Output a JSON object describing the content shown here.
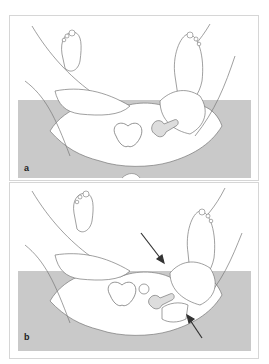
{
  "figure": {
    "colors": {
      "background": "#ffffff",
      "table_gray": "#c9c9c9",
      "line": "#6f6f6f",
      "arrow": "#333333",
      "frame": "#d6d6d6"
    },
    "panels": [
      {
        "label": "a",
        "arrows": 0
      },
      {
        "label": "b",
        "arrows": 2
      }
    ]
  }
}
